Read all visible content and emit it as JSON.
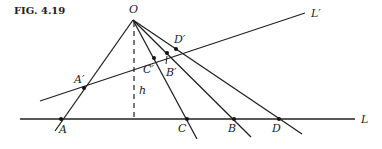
{
  "figure": {
    "caption": "FIG. 4.19"
  },
  "labels": {
    "O": "O",
    "L_prime": "L′",
    "L": "L",
    "D_prime": "D′",
    "C_prime": "C′",
    "B_prime": "B′",
    "A_prime": "A′",
    "h": "h",
    "A": "A",
    "C": "C",
    "B": "B",
    "D": "D"
  }
}
